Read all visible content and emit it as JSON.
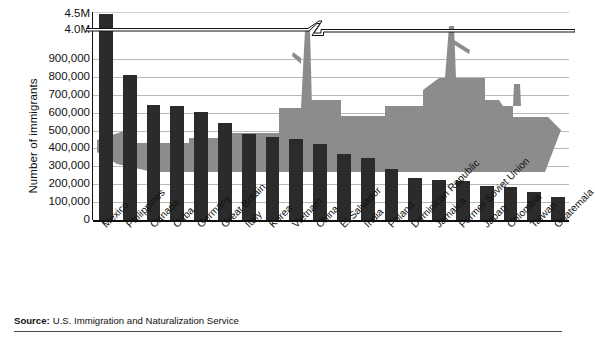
{
  "chart_data": {
    "type": "bar",
    "title": "",
    "xlabel": "",
    "ylabel": "Number of immigrants",
    "categories": [
      "Mexico",
      "Philippines",
      "Canada",
      "Cuba",
      "Germany",
      "Great Britain",
      "Italy",
      "Korea",
      "Vietnam",
      "China",
      "El Salvador",
      "India",
      "Poland",
      "Dominican Republic",
      "Jamaica",
      "Former Soviet Union",
      "Japan",
      "Colombia",
      "Taiwan",
      "Guatemala"
    ],
    "values": [
      4300000,
      810000,
      640000,
      635000,
      605000,
      540000,
      480000,
      465000,
      450000,
      425000,
      370000,
      345000,
      285000,
      235000,
      225000,
      220000,
      190000,
      185000,
      155000,
      130000
    ],
    "value_labels": [
      "4.3M",
      "810,000",
      "640,000",
      "635,000",
      "605,000",
      "540,000",
      "480,000",
      "465,000",
      "450,000",
      "425,000",
      "370,000",
      "345,000",
      "285,000",
      "235,000",
      "225,000",
      "220,000",
      "190,000",
      "185,000",
      "155,000",
      "130,000"
    ],
    "ytick_labels": [
      "4.5M",
      "4.0M",
      "900,000",
      "800,000",
      "700,000",
      "600,000",
      "500,000",
      "400,000",
      "300,000",
      "200,000",
      "100,000",
      "0"
    ],
    "ytick_values": [
      4500000,
      4000000,
      900000,
      800000,
      700000,
      600000,
      500000,
      400000,
      300000,
      200000,
      100000,
      0
    ],
    "ylim": [
      0,
      1000000
    ],
    "axis_break": true,
    "axis_break_between": [
      "900,000",
      "4.0M"
    ],
    "grid": true,
    "legend": "none",
    "bar_color": "#2b2b2b",
    "grid_color": "#b9b9b9",
    "watermark": "ship-silhouette",
    "watermark_color": "#8c8c8c"
  },
  "source": {
    "label": "Source:",
    "text": "U.S. Immigration and Naturalization Service"
  },
  "icons": {
    "watermark": "ship-icon"
  }
}
